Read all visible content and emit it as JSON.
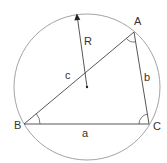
{
  "diagram": {
    "colors": {
      "circle": "#999999",
      "lines": "#444444",
      "text": "#333333"
    },
    "circle": {
      "cx": 87,
      "cy": 87,
      "r": 73
    },
    "center": {
      "x": 87,
      "y": 87
    },
    "radius_label": "R",
    "vertices": [
      {
        "name": "A",
        "x": 134,
        "y": 32,
        "label_x": 134,
        "label_y": 25
      },
      {
        "name": "B",
        "x": 24,
        "y": 124,
        "label_x": 14,
        "label_y": 129
      },
      {
        "name": "C",
        "x": 149,
        "y": 124,
        "label_x": 153,
        "label_y": 130
      }
    ],
    "sides": [
      {
        "name": "a",
        "label": "a",
        "label_x": 82,
        "label_y": 137
      },
      {
        "name": "b",
        "label": "b",
        "label_x": 144,
        "label_y": 81
      },
      {
        "name": "c",
        "label": "c",
        "label_x": 65,
        "label_y": 79
      }
    ],
    "labels": {
      "A": "A",
      "B": "B",
      "C": "C",
      "a": "a",
      "b": "b",
      "c": "c",
      "R": "R"
    }
  }
}
